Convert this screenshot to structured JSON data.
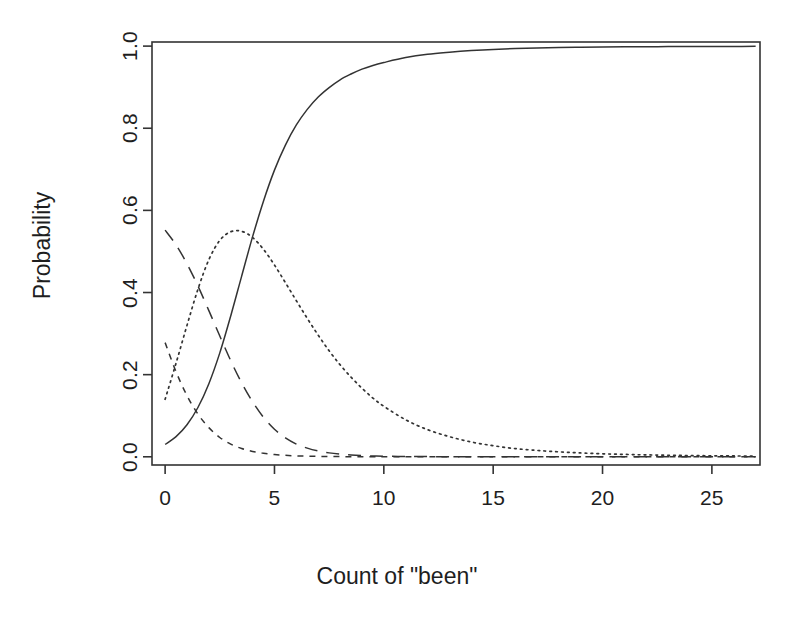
{
  "chart_data": {
    "type": "line",
    "title": "",
    "xlabel": "Count of \"been\"",
    "ylabel": "Probability",
    "xlim": [
      -0.6,
      27.2
    ],
    "ylim": [
      -0.02,
      1.01
    ],
    "grid": false,
    "legend": "none",
    "background": "#ffffff",
    "line_color": "#333333",
    "xticks": [
      0,
      5,
      10,
      15,
      20,
      25
    ],
    "xtick_labels": [
      "0",
      "5",
      "10",
      "15",
      "20",
      "25"
    ],
    "yticks": [
      0.0,
      0.2,
      0.4,
      0.6,
      0.8,
      1.0
    ],
    "ytick_labels": [
      "0.0",
      "0.2",
      "0.4",
      "0.6",
      "0.8",
      "1.0"
    ],
    "x": [
      0,
      0.5,
      1,
      1.5,
      2,
      2.5,
      3,
      3.5,
      4,
      4.5,
      5,
      5.5,
      6,
      6.5,
      7,
      7.5,
      8,
      8.5,
      9,
      9.5,
      10,
      11,
      12,
      13,
      14,
      15,
      16,
      17,
      18,
      19,
      20,
      21,
      22,
      23,
      24,
      25,
      26,
      27
    ],
    "series": [
      {
        "name": "solid-curve",
        "style": "solid",
        "values": [
          0.03,
          0.049,
          0.078,
          0.12,
          0.178,
          0.253,
          0.343,
          0.44,
          0.536,
          0.623,
          0.698,
          0.759,
          0.808,
          0.846,
          0.876,
          0.899,
          0.918,
          0.932,
          0.944,
          0.953,
          0.96,
          0.972,
          0.98,
          0.985,
          0.989,
          0.992,
          0.994,
          0.9955,
          0.9965,
          0.9972,
          0.9978,
          0.9982,
          0.9985,
          0.9988,
          0.999,
          0.9992,
          0.9993,
          0.9994
        ]
      },
      {
        "name": "long-dash-curve",
        "style": "longdash",
        "values": [
          0.552,
          0.516,
          0.47,
          0.416,
          0.356,
          0.294,
          0.234,
          0.18,
          0.134,
          0.096,
          0.067,
          0.046,
          0.031,
          0.021,
          0.014,
          0.0095,
          0.0064,
          0.0043,
          0.0029,
          0.002,
          0.0014,
          0.0007,
          0.0004,
          0.0002,
          0.0001,
          0.0001,
          0.0,
          0.0,
          0.0,
          0.0,
          0.0,
          0.0,
          0.0,
          0.0,
          0.0,
          0.0,
          0.0,
          0.0
        ]
      },
      {
        "name": "dotted-curve",
        "style": "dotted",
        "values": [
          0.14,
          0.228,
          0.32,
          0.408,
          0.48,
          0.527,
          0.548,
          0.549,
          0.534,
          0.505,
          0.467,
          0.424,
          0.38,
          0.337,
          0.296,
          0.258,
          0.224,
          0.194,
          0.167,
          0.143,
          0.123,
          0.09,
          0.066,
          0.049,
          0.036,
          0.027,
          0.02,
          0.0155,
          0.012,
          0.0093,
          0.0073,
          0.0058,
          0.0046,
          0.0037,
          0.003,
          0.0024,
          0.002,
          0.0016
        ]
      },
      {
        "name": "short-dash-curve",
        "style": "shortdash",
        "values": [
          0.278,
          0.207,
          0.149,
          0.104,
          0.071,
          0.047,
          0.031,
          0.02,
          0.013,
          0.0085,
          0.0055,
          0.0036,
          0.0023,
          0.0015,
          0.001,
          0.0007,
          0.0004,
          0.0003,
          0.0002,
          0.0001,
          0.0001,
          0.0,
          0.0,
          0.0,
          0.0,
          0.0,
          0.0,
          0.0,
          0.0,
          0.0,
          0.0,
          0.0,
          0.0,
          0.0,
          0.0,
          0.0,
          0.0,
          0.0
        ]
      }
    ]
  },
  "axes": {
    "x_title": "Count of \"been\"",
    "y_title": "Probability"
  }
}
